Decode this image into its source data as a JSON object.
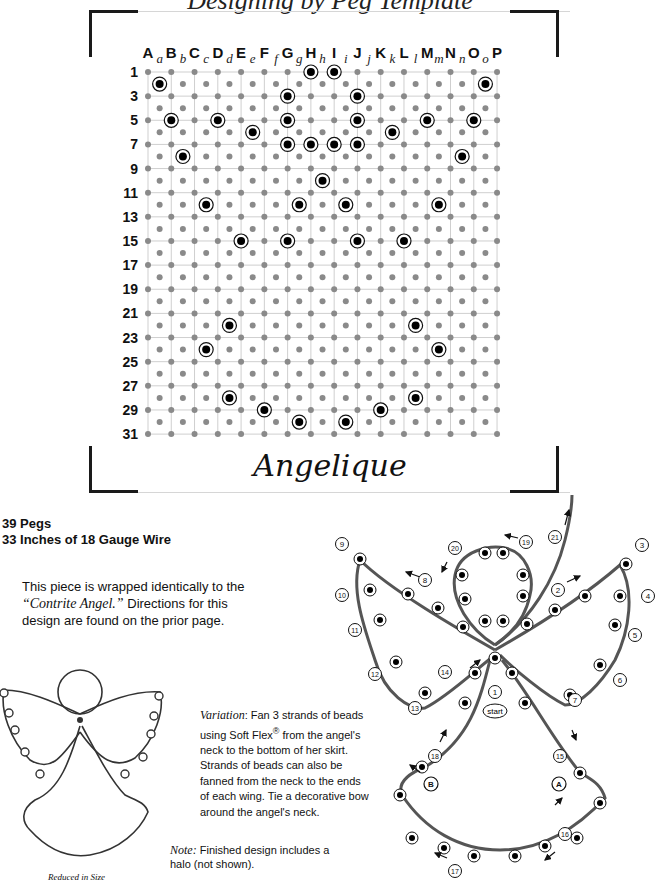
{
  "header": {
    "cropped_title": "Designing by Peg Template"
  },
  "peg_template": {
    "upper_columns": [
      "A",
      "B",
      "C",
      "D",
      "E",
      "F",
      "G",
      "H",
      "I",
      "J",
      "K",
      "L",
      "M",
      "N",
      "O",
      "P"
    ],
    "lower_columns": [
      "a",
      "b",
      "c",
      "d",
      "e",
      "f",
      "g",
      "h",
      "i",
      "j",
      "k",
      "l",
      "m",
      "n",
      "o"
    ],
    "row_labels": [
      "1",
      "3",
      "5",
      "7",
      "9",
      "11",
      "13",
      "15",
      "17",
      "19",
      "21",
      "23",
      "25",
      "27",
      "29",
      "31"
    ],
    "row_count": 31,
    "pegs": [
      {
        "row": 1,
        "col": "H"
      },
      {
        "row": 1,
        "col": "I"
      },
      {
        "row": 2,
        "col": "a"
      },
      {
        "row": 2,
        "col": "o"
      },
      {
        "row": 3,
        "col": "G"
      },
      {
        "row": 3,
        "col": "J"
      },
      {
        "row": 5,
        "col": "B"
      },
      {
        "row": 5,
        "col": "D"
      },
      {
        "row": 5,
        "col": "G"
      },
      {
        "row": 5,
        "col": "J"
      },
      {
        "row": 5,
        "col": "M"
      },
      {
        "row": 5,
        "col": "O"
      },
      {
        "row": 6,
        "col": "e"
      },
      {
        "row": 6,
        "col": "k"
      },
      {
        "row": 7,
        "col": "G"
      },
      {
        "row": 7,
        "col": "H"
      },
      {
        "row": 7,
        "col": "I"
      },
      {
        "row": 7,
        "col": "J"
      },
      {
        "row": 8,
        "col": "b"
      },
      {
        "row": 8,
        "col": "n"
      },
      {
        "row": 10,
        "col": "h"
      },
      {
        "row": 12,
        "col": "c"
      },
      {
        "row": 12,
        "col": "g"
      },
      {
        "row": 12,
        "col": "i"
      },
      {
        "row": 12,
        "col": "m"
      },
      {
        "row": 15,
        "col": "E"
      },
      {
        "row": 15,
        "col": "G"
      },
      {
        "row": 15,
        "col": "J"
      },
      {
        "row": 15,
        "col": "L"
      },
      {
        "row": 22,
        "col": "d"
      },
      {
        "row": 22,
        "col": "l"
      },
      {
        "row": 24,
        "col": "c"
      },
      {
        "row": 24,
        "col": "m"
      },
      {
        "row": 28,
        "col": "d"
      },
      {
        "row": 28,
        "col": "l"
      },
      {
        "row": 29,
        "col": "F"
      },
      {
        "row": 29,
        "col": "K"
      },
      {
        "row": 30,
        "col": "g"
      },
      {
        "row": 30,
        "col": "i"
      }
    ],
    "design_name": "Angelique",
    "colors": {
      "grid_dot": "#8a8a8a",
      "grid_line": "#cfcfcf",
      "peg": "#000000"
    }
  },
  "specs": {
    "pegs": "39 Pegs",
    "wire": "33 Inches of 18 Gauge Wire"
  },
  "intro": {
    "before": "This piece is wrapped identically to the ",
    "reference": "“Contrite Angel.”",
    "after": "  Directions for this design are found on the prior page."
  },
  "variation": {
    "label": "Variation",
    "text_1": ":  Fan 3 strands of beads using Soft Flex",
    "reg": "®",
    "text_2": " from the angel's neck to the bottom of her skirt. Strands of beads can also be fanned from the neck to the ends of each wing.  Tie a decorative bow around the angel's neck."
  },
  "note": {
    "label": "Note:",
    "text": "  Finished design includes a halo (not shown)."
  },
  "preview": {
    "caption": "Reduced in Size"
  },
  "wrap_diagram": {
    "start_label": "start",
    "step_labels": [
      "1",
      "2",
      "3",
      "4",
      "5",
      "6",
      "7",
      "8",
      "9",
      "10",
      "11",
      "12",
      "13",
      "14",
      "15",
      "16",
      "17",
      "18",
      "19",
      "20",
      "21"
    ],
    "markers": [
      "A",
      "B"
    ]
  }
}
